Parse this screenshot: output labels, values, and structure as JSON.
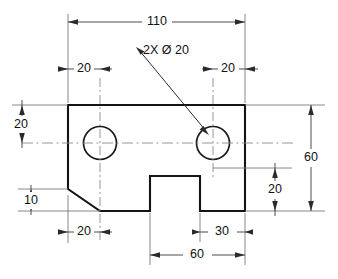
{
  "drawing": {
    "title": "Mechanical part orthographic drawing",
    "units_implied": "mm",
    "colors": {
      "outline": "#141414",
      "dimension": "#4d4d4d",
      "extension": "#7a7a7a",
      "centerline": "#8a8a8a",
      "background": "#ffffff",
      "text": "#111111"
    },
    "annotations": {
      "hole_note": "2X Ø 20",
      "overall_width": "110",
      "hole_offset_left": "20",
      "hole_offset_right": "20",
      "hole_center_height_from_top": "20",
      "overall_height": "60",
      "notch_height": "20",
      "chamfer_height": "10",
      "chamfer_width": "20",
      "notch_right_offset": "30",
      "notch_span_dim": "60"
    },
    "labels": [
      {
        "id": "top-overall",
        "text": "110"
      },
      {
        "id": "hole-note",
        "text": "2X Ø 20"
      },
      {
        "id": "top-left-20",
        "text": "20"
      },
      {
        "id": "top-right-20",
        "text": "20"
      },
      {
        "id": "left-20",
        "text": "20"
      },
      {
        "id": "left-10",
        "text": "10"
      },
      {
        "id": "bottom-left-20",
        "text": "20"
      },
      {
        "id": "bottom-30",
        "text": "30"
      },
      {
        "id": "bottom-60",
        "text": "60"
      },
      {
        "id": "right-60",
        "text": "60"
      },
      {
        "id": "right-20",
        "text": "20"
      }
    ],
    "geometry": {
      "outline_description": "Rectangular plate 110 wide by 60 tall with a 20x20 chamfer at lower-left corner and a rectangular notch cut in the bottom edge",
      "hole_count": 2,
      "hole_diameter": 20
    }
  }
}
